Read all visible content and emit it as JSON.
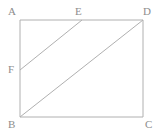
{
  "figure": {
    "kind": "geometry-diagram",
    "background_color": "#ffffff",
    "stroke_color": "#b0b0b0",
    "label_color": "#8d8d8d",
    "stroke_width": 1,
    "canvas": {
      "width": 163,
      "height": 136
    }
  },
  "labels": {
    "a": "A",
    "b": "B",
    "c": "C",
    "d": "D",
    "e": "E",
    "f": "F"
  },
  "points": {
    "A": {
      "x": 20,
      "y": 20,
      "label": "A",
      "label_x": 8,
      "label_y": 6
    },
    "B": {
      "x": 20,
      "y": 117,
      "label": "B",
      "label_x": 8,
      "label_y": 119
    },
    "C": {
      "x": 143,
      "y": 117,
      "label": "C",
      "label_x": 145,
      "label_y": 119
    },
    "D": {
      "x": 143,
      "y": 20,
      "label": "D",
      "label_x": 143,
      "label_y": 6
    },
    "E": {
      "x": 82,
      "y": 20,
      "label": "E",
      "label_x": 75,
      "label_y": 6
    },
    "F": {
      "x": 20,
      "y": 70,
      "label": "F",
      "label_x": 8,
      "label_y": 64
    }
  },
  "segments": [
    {
      "name": "side-ab",
      "from": "A",
      "to": "B"
    },
    {
      "name": "side-ad",
      "from": "A",
      "to": "D"
    },
    {
      "name": "side-dc",
      "from": "D",
      "to": "C"
    },
    {
      "name": "side-bc",
      "from": "B",
      "to": "C"
    },
    {
      "name": "segment-fe",
      "from": "F",
      "to": "E"
    },
    {
      "name": "diagonal-bd",
      "from": "B",
      "to": "D"
    }
  ]
}
